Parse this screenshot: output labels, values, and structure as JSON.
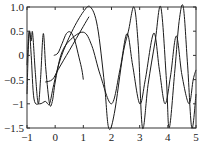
{
  "chart_data": {
    "type": "line",
    "title": "",
    "xlabel": "",
    "ylabel": "",
    "xlim": [
      -1,
      5
    ],
    "ylim": [
      -1.5,
      1.0
    ],
    "grid": false,
    "legend": null,
    "x_ticks": [
      "-1",
      "0",
      "1",
      "2",
      "3",
      "4",
      "5"
    ],
    "y_ticks": [
      "1.0",
      "0.5",
      "0",
      "-0.5",
      "-1",
      "-1.5"
    ],
    "series": [
      {
        "name": "curve-a",
        "description": "oscillating chirp between -1 and 0.5",
        "points": [
          [
            -1,
            -0.8
          ],
          [
            -0.93,
            0.45
          ],
          [
            -0.85,
            0.3
          ],
          [
            -0.8,
            0.47
          ],
          [
            -0.7,
            -0.4
          ],
          [
            -0.6,
            -1.0
          ],
          [
            -0.52,
            -0.5
          ],
          [
            -0.42,
            0.45
          ],
          [
            -0.33,
            -0.3
          ],
          [
            -0.2,
            -1.0
          ],
          [
            -0.1,
            -0.95
          ],
          [
            0.0,
            -0.55
          ],
          [
            0.2,
            0.0
          ],
          [
            0.5,
            0.3
          ],
          [
            1.0,
            0.48
          ],
          [
            1.3,
            0.2
          ],
          [
            1.6,
            -0.4
          ],
          [
            2.0,
            -1.0
          ],
          [
            2.3,
            -0.3
          ],
          [
            2.55,
            0.45
          ],
          [
            2.75,
            -0.2
          ],
          [
            3.0,
            -1.0
          ],
          [
            3.2,
            -0.5
          ],
          [
            3.5,
            0.46
          ],
          [
            3.7,
            -0.3
          ],
          [
            3.9,
            -1.0
          ],
          [
            4.1,
            -0.4
          ],
          [
            4.3,
            0.4
          ],
          [
            4.5,
            -0.4
          ],
          [
            4.75,
            -1.0
          ],
          [
            4.9,
            -0.5
          ],
          [
            5.0,
            -0.3
          ]
        ]
      },
      {
        "name": "curve-b",
        "description": "oscillating chirp between -1.5 and 1.0",
        "points": [
          [
            -1,
            -0.2
          ],
          [
            -0.92,
            0.5
          ],
          [
            -0.85,
            0.0
          ],
          [
            -0.75,
            -0.9
          ],
          [
            -0.55,
            -1.0
          ],
          [
            -0.35,
            -0.95
          ],
          [
            -0.2,
            -1.0
          ],
          [
            -0.05,
            -0.6
          ],
          [
            0.2,
            -0.05
          ],
          [
            0.6,
            0.5
          ],
          [
            1.0,
            0.9
          ],
          [
            1.25,
            1.0
          ],
          [
            1.5,
            0.6
          ],
          [
            1.75,
            -0.6
          ],
          [
            1.9,
            -1.5
          ],
          [
            2.1,
            -1.2
          ],
          [
            2.4,
            0.0
          ],
          [
            2.6,
            0.5
          ],
          [
            2.8,
            1.0
          ],
          [
            2.95,
            0.2
          ],
          [
            3.1,
            -1.5
          ],
          [
            3.3,
            -0.6
          ],
          [
            3.55,
            0.3
          ],
          [
            3.75,
            1.0
          ],
          [
            3.95,
            -0.5
          ],
          [
            4.05,
            -1.5
          ],
          [
            4.25,
            -0.3
          ],
          [
            4.4,
            0.7
          ],
          [
            4.55,
            1.0
          ],
          [
            4.7,
            -0.2
          ],
          [
            4.85,
            -1.5
          ],
          [
            5.0,
            -0.8
          ]
        ]
      },
      {
        "name": "curve-c",
        "description": "short arc from origin peaking near 0.5",
        "points": [
          [
            -0.05,
            0.0
          ],
          [
            0.1,
            0.05
          ],
          [
            0.25,
            0.25
          ],
          [
            0.4,
            0.45
          ],
          [
            0.55,
            0.48
          ],
          [
            0.7,
            0.3
          ],
          [
            0.85,
            -0.05
          ],
          [
            0.95,
            -0.3
          ],
          [
            1.0,
            -0.5
          ]
        ]
      },
      {
        "name": "curve-d",
        "description": "rising line from lower-left",
        "points": [
          [
            -0.35,
            -0.55
          ],
          [
            -0.1,
            -0.5
          ],
          [
            0.1,
            -0.3
          ],
          [
            0.3,
            -0.1
          ],
          [
            0.5,
            0.1
          ],
          [
            0.75,
            0.35
          ],
          [
            1.0,
            0.6
          ],
          [
            1.2,
            0.8
          ]
        ]
      }
    ],
    "stroke_color": "#1a1a1a",
    "axis_color": "#333333"
  }
}
